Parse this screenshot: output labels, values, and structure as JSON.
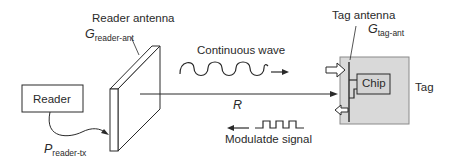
{
  "diagram": {
    "reader": {
      "label": "Reader"
    },
    "reader_antenna": {
      "label": "Reader antenna",
      "gain_symbol": "G",
      "gain_subscript": "reader-ant"
    },
    "reader_power": {
      "symbol": "P",
      "subscript": "reader-tx"
    },
    "continuous_wave": {
      "label": "Continuous wave"
    },
    "distance": {
      "label": "R"
    },
    "modulated_signal": {
      "label": "Modulatde signal"
    },
    "tag_antenna": {
      "label": "Tag antenna",
      "gain_symbol": "G",
      "gain_subscript": "tag-ant"
    },
    "chip": {
      "label": "Chip"
    },
    "tag": {
      "label": "Tag"
    },
    "colors": {
      "line": "#2a2a2a",
      "tag_fill": "#d9d9d9",
      "background": "#ffffff"
    }
  }
}
